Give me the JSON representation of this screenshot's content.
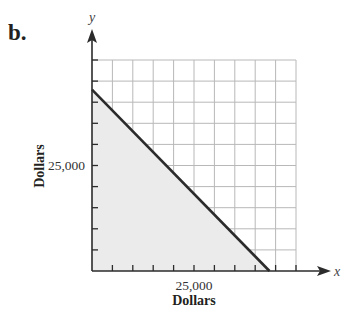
{
  "panel_label": "b.",
  "chart_data": {
    "type": "area",
    "title": "",
    "panel": "b.",
    "xlabel": "Dollars",
    "ylabel": "Dollars",
    "x_axis_variable": "x",
    "y_axis_variable": "y",
    "xlim": [
      0,
      50000
    ],
    "ylim": [
      0,
      50000
    ],
    "grid": true,
    "grid_step": 5000,
    "x_tick_labels": [
      {
        "value": 25000,
        "label": "25,000"
      }
    ],
    "y_tick_labels": [
      {
        "value": 25000,
        "label": "25,000"
      }
    ],
    "series": [
      {
        "name": "boundary line",
        "type": "line",
        "x": [
          0,
          43500
        ],
        "y": [
          43000,
          0
        ]
      }
    ],
    "shaded_region": {
      "description": "Region below the line in the first quadrant (x >= 0, y >= 0, under boundary)",
      "vertices": [
        [
          0,
          0
        ],
        [
          0,
          43000
        ],
        [
          43500,
          0
        ]
      ],
      "color": "#ebebeb"
    },
    "legend": null
  },
  "colors": {
    "line": "#2b2b2b",
    "axis": "#2b2b2b",
    "grid": "#b8b8b8",
    "fill": "#ebebeb",
    "text": "#231f20"
  },
  "labels": {
    "x_var": "x",
    "y_var": "y",
    "x_tick_25000": "25,000",
    "y_tick_25000": "25,000",
    "x_title": "Dollars",
    "y_title": "Dollars"
  }
}
